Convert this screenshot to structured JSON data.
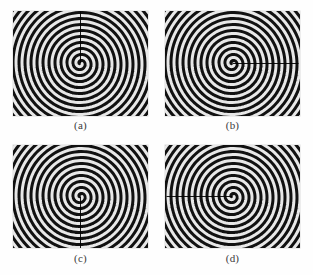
{
  "figure": {
    "background_color": "#ffffff",
    "panel_background": "#111111",
    "spiral_light_color": "#e8e8e8",
    "spiral_dark_color": "#111111",
    "marker_line_color": "#000000",
    "caption_color": "#3a3a3a",
    "panels": [
      {
        "id": "a",
        "caption": "(a)",
        "marker_direction": "up",
        "marker_angle_deg": 270,
        "center_x_px": 79,
        "center_y_px": 62,
        "width_px": 135,
        "height_px": 105
      },
      {
        "id": "b",
        "caption": "(b)",
        "marker_direction": "right",
        "marker_angle_deg": 0,
        "center_x_px": 236,
        "center_y_px": 63,
        "width_px": 135,
        "height_px": 105
      },
      {
        "id": "c",
        "caption": "(c)",
        "marker_direction": "down",
        "marker_angle_deg": 90,
        "center_x_px": 78,
        "center_y_px": 190,
        "width_px": 135,
        "height_px": 103
      },
      {
        "id": "d",
        "caption": "(d)",
        "marker_direction": "left",
        "marker_angle_deg": 180,
        "center_x_px": 237,
        "center_y_px": 190,
        "width_px": 135,
        "height_px": 103
      }
    ]
  },
  "chart_data": {
    "type": "line",
    "title": "",
    "xlabel": "",
    "ylabel": "",
    "series": [
      {
        "name": "(a) spiral with upward radial marker",
        "spiral_type": "archimedean",
        "turns": 11,
        "arm_count": 1,
        "pitch_px": 6.0,
        "start_radius_px": 1.5,
        "rotation_deg": 0,
        "marker_angle_deg": 270,
        "marker_length_px": 52
      },
      {
        "name": "(b) spiral with rightward radial marker",
        "spiral_type": "archimedean",
        "turns": 11,
        "arm_count": 1,
        "pitch_px": 6.0,
        "start_radius_px": 1.5,
        "rotation_deg": 0,
        "marker_angle_deg": 0,
        "marker_length_px": 66
      },
      {
        "name": "(c) spiral with downward radial marker",
        "spiral_type": "archimedean",
        "turns": 11,
        "arm_count": 1,
        "pitch_px": 6.0,
        "start_radius_px": 1.5,
        "rotation_deg": 0,
        "marker_angle_deg": 90,
        "marker_length_px": 58
      },
      {
        "name": "(d) spiral with leftward radial marker",
        "spiral_type": "archimedean",
        "turns": 11,
        "arm_count": 1,
        "pitch_px": 6.0,
        "start_radius_px": 1.5,
        "rotation_deg": 0,
        "marker_angle_deg": 180,
        "marker_length_px": 66
      }
    ],
    "categories": [
      "(a)",
      "(b)",
      "(c)",
      "(d)"
    ],
    "legend_position": "none",
    "grid": false
  }
}
